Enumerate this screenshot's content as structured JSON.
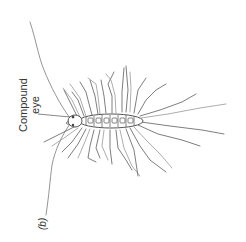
{
  "figure": {
    "panel_label": "(b)",
    "labels": {
      "compound_eye_line1": "Compound",
      "compound_eye_line2": "eye"
    },
    "colors": {
      "background": "#ffffff",
      "line": "#6f6f6f",
      "text": "#333333"
    },
    "orientation": "rotated 90° counter-clockwise"
  }
}
